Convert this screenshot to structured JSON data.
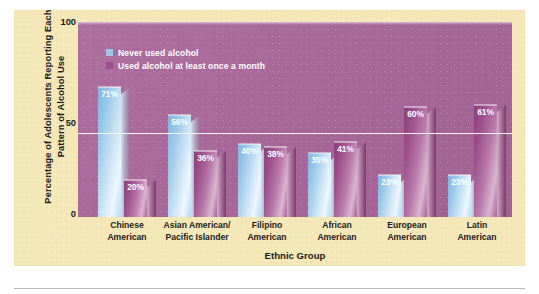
{
  "chart_data": {
    "type": "bar",
    "title": "",
    "xlabel": "Ethnic Group",
    "ylabel": "Percentage of Adolescents Reporting Each Pattern of Alcohol Use",
    "categories": [
      "Chinese\nAmerican",
      "Asian American/\nPacific Islander",
      "Filipino\nAmerican",
      "African\nAmerican",
      "European\nAmerican",
      "Latin\nAmerican"
    ],
    "series": [
      {
        "name": "Never used alcohol",
        "color": "#9cc9ea",
        "values": [
          71,
          56,
          40,
          35,
          23,
          23
        ],
        "value_labels": [
          "71%",
          "56%",
          "40%",
          "35%",
          "23%",
          "23%"
        ]
      },
      {
        "name": "Used alcohol at least once a month",
        "color": "#9d4f8b",
        "values": [
          20,
          36,
          38,
          41,
          60,
          61
        ],
        "value_labels": [
          "20%",
          "36%",
          "38%",
          "41%",
          "60%",
          "61%"
        ]
      }
    ],
    "ylim": [
      0,
      100
    ],
    "yticks": [
      0,
      50,
      100
    ],
    "ytick_labels": [
      "0",
      "50",
      "100"
    ],
    "grid": "horizontal-at-50",
    "legend_position": "top-left-inside",
    "plot_background_color": "#a9669a",
    "panel_background_color": "#f4e8b8"
  },
  "legend": {
    "items": [
      {
        "label": "Never used alcohol",
        "color": "#9cc9ea"
      },
      {
        "label": "Used alcohol at least once a month",
        "color": "#9d4f8b"
      }
    ]
  },
  "axes": {
    "y_title": "Percentage of Adolescents Reporting Each Pattern of Alcohol Use",
    "x_title": "Ethnic Group",
    "y_tick_100": "100",
    "y_tick_50": "50",
    "y_tick_0": "0"
  }
}
